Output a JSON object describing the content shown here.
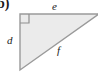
{
  "figure": {
    "part_label": "b)",
    "shape": "right-triangle",
    "fill_color": "#ebebeb",
    "stroke_color": "#9a9a9a",
    "label_color": "#1a1a1a",
    "background_color": "#ffffff",
    "right_angle_marker": {
      "present": true,
      "vertex": "top-left",
      "size": 9
    },
    "vertices": {
      "top_left": [
        20,
        14
      ],
      "top_right": [
        97,
        14
      ],
      "bottom_left": [
        20,
        70
      ]
    },
    "sides": [
      {
        "name": "e",
        "label": "e",
        "position": "top",
        "role": "leg"
      },
      {
        "name": "d",
        "label": "d",
        "position": "left",
        "role": "leg"
      },
      {
        "name": "f",
        "label": "f",
        "position": "hypotenuse",
        "role": "hypotenuse"
      }
    ]
  }
}
